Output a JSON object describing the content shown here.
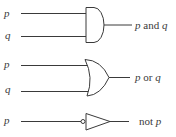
{
  "diagram": {
    "type": "logic-gates",
    "stroke_color": "#3a3a3a",
    "background": "#ffffff",
    "gates": [
      {
        "kind": "AND",
        "inputs": [
          "p",
          "q"
        ],
        "output_label": {
          "var1": "p",
          "op": "and",
          "var2": "q"
        }
      },
      {
        "kind": "OR",
        "inputs": [
          "p",
          "q"
        ],
        "output_label": {
          "var1": "p",
          "op": "or",
          "var2": "q"
        }
      },
      {
        "kind": "NOT",
        "inputs": [
          "p"
        ],
        "output_label": {
          "op": "not",
          "var1": "p"
        }
      }
    ]
  }
}
